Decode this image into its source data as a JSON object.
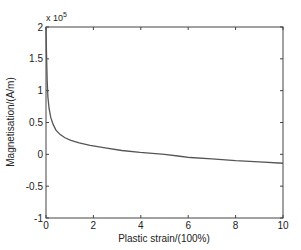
{
  "chart_data": {
    "type": "line",
    "title": "",
    "xlabel": "Plastic strain/(100%)",
    "ylabel": "Magnetisation/(A/m)",
    "y_multiplier_label": "x 10",
    "y_multiplier_exp": "5",
    "xlim": [
      0,
      10
    ],
    "ylim": [
      -1,
      2
    ],
    "x_ticks": [
      0,
      2,
      4,
      6,
      8,
      10
    ],
    "y_ticks": [
      -1,
      -0.5,
      0,
      0.5,
      1,
      1.5,
      2
    ],
    "x_tick_labels": [
      "0",
      "2",
      "4",
      "6",
      "8",
      "10"
    ],
    "y_tick_labels": [
      "-1",
      "-0.5",
      "0",
      "0.5",
      "1",
      "1.5",
      "2"
    ],
    "grid": false,
    "legend": null,
    "series": [
      {
        "name": "Magnetisation",
        "color": "#555555",
        "x": [
          0.0,
          0.02,
          0.05,
          0.08,
          0.13,
          0.2,
          0.3,
          0.42,
          0.6,
          0.8,
          1.05,
          1.4,
          1.86,
          2.5,
          3.2,
          3.97,
          5.0,
          5.65,
          6.08,
          7.0,
          8.0,
          9.0,
          10.0
        ],
        "values": [
          2.0,
          1.6,
          1.15,
          0.9,
          0.72,
          0.58,
          0.47,
          0.38,
          0.31,
          0.26,
          0.22,
          0.18,
          0.14,
          0.1,
          0.06,
          0.03,
          0.0,
          -0.03,
          -0.05,
          -0.07,
          -0.1,
          -0.12,
          -0.14
        ]
      }
    ]
  }
}
